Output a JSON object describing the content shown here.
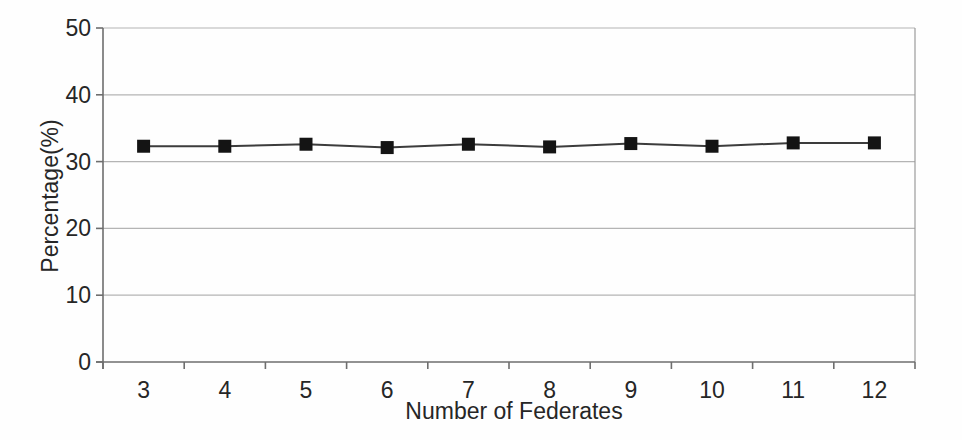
{
  "chart_data": {
    "type": "line",
    "title": "",
    "xlabel": "Number of Federates",
    "ylabel": "Percentage(%)",
    "x": [
      3,
      4,
      5,
      6,
      7,
      8,
      9,
      10,
      11,
      12
    ],
    "series": [
      {
        "name": "Percentage",
        "marker": "square",
        "values": [
          32.3,
          32.3,
          32.6,
          32.1,
          32.6,
          32.2,
          32.7,
          32.3,
          32.8,
          32.8
        ]
      }
    ],
    "ylim": [
      0,
      50
    ],
    "yticks": [
      0,
      10,
      20,
      30,
      40,
      50
    ],
    "grid": "horizontal",
    "legend": "none",
    "colors": {
      "background": "#fefefe",
      "text": "#262626",
      "axis": "#6e6e6e",
      "gridline": "#b4b4b4",
      "plot_right_border": "#9a9a9a",
      "series_line": "#3c3c3c",
      "marker": "#141414"
    }
  }
}
